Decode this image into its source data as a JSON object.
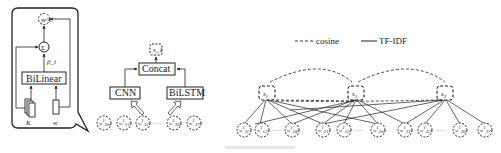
{
  "panel_a": {
    "output_node": "w^c",
    "sum_symbol": "Σ",
    "weight_label": "β_i",
    "bilinear_label": "BiLinear",
    "input_k": "K",
    "input_w": "w"
  },
  "panel_b": {
    "output_node": "s_1",
    "concat_label": "Concat",
    "cnn_label": "CNN",
    "bilstm_label": "BiLSTM",
    "word_nodes": [
      {
        "base": "w",
        "sup": "1",
        "sub": "2n"
      },
      {
        "base": "w",
        "sup": "1",
        "sub": "31"
      },
      {
        "base": "w",
        "sup": "1",
        "sub": "32"
      },
      {
        "base": "w",
        "sup": "1",
        "sub": "36"
      },
      {
        "base": "w",
        "sup": "1",
        "sub": "37"
      }
    ],
    "ellipsis": "······"
  },
  "panel_c": {
    "legend": {
      "cosine_label": "cosine",
      "tfidf_label": "TF-IDF"
    },
    "sentence_nodes": [
      {
        "base": "s",
        "sub": "1"
      },
      {
        "base": "s",
        "sub": "2"
      },
      {
        "base": "s",
        "sub": "3"
      }
    ],
    "word_nodes": [
      {
        "base": "w",
        "sup": "1",
        "sub": "11"
      },
      {
        "base": "w",
        "sup": "1",
        "sub": "12"
      },
      {
        "base": "w",
        "sup": "1",
        "sub": "18"
      },
      {
        "base": "w",
        "sup": "1",
        "sub": "21"
      },
      {
        "base": "w",
        "sup": "1",
        "sub": "22"
      },
      {
        "base": "w",
        "sup": "1",
        "sub": "2n"
      },
      {
        "base": "w",
        "sup": "1",
        "sub": "31"
      },
      {
        "base": "w",
        "sup": "1",
        "sub": "32"
      },
      {
        "base": "w",
        "sup": "1",
        "sub": "36"
      },
      {
        "base": "w",
        "sup": "1",
        "sub": "37"
      }
    ],
    "ellipsis": "······"
  },
  "colors": {
    "stroke": "#222222",
    "background": "#ffffff",
    "dashed": "#333333"
  }
}
